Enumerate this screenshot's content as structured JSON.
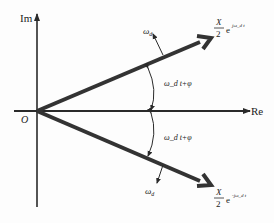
{
  "diagram": {
    "axes": {
      "imaginary_label": "Im",
      "real_label": "Re",
      "origin_label": "O"
    },
    "upper_phasor": {
      "magnitude_num": "X",
      "magnitude_den": "2",
      "exp_base": "e",
      "exponent": "jω_d t",
      "rotation_label": "ω",
      "rotation_sub": "d",
      "angle_label": "ω_d t+φ"
    },
    "lower_phasor": {
      "magnitude_num": "X",
      "magnitude_den": "2",
      "exp_base": "e",
      "exponent": "-jω_d t",
      "rotation_label": "ω",
      "rotation_sub": "d",
      "angle_label": "ω_d t+φ"
    },
    "colors": {
      "line": "#2a2a2a",
      "text": "#222222"
    }
  }
}
